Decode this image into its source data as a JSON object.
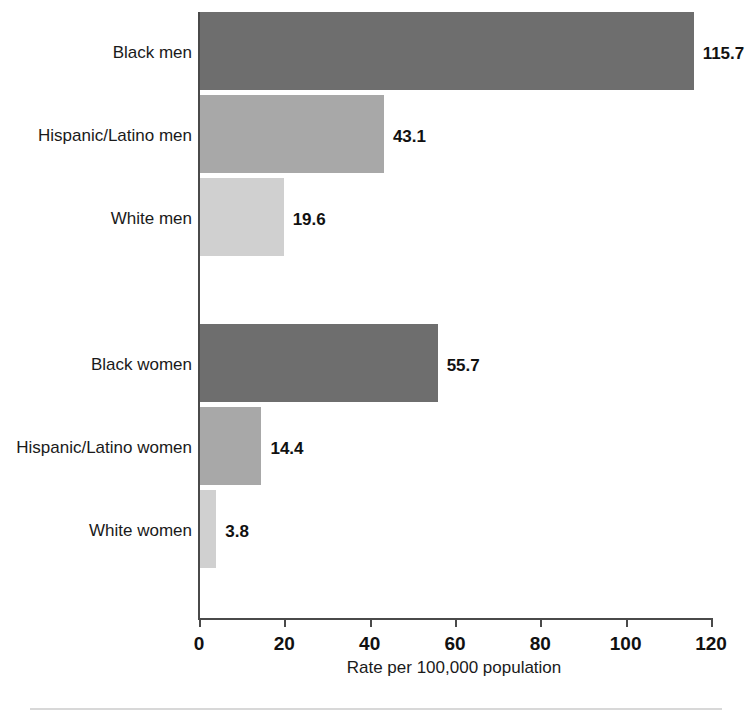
{
  "chart_data": {
    "type": "bar",
    "orientation": "horizontal",
    "title": "",
    "subtitle": "",
    "xlabel": "Rate per 100,000 population",
    "ylabel": "",
    "xlim": [
      0,
      120
    ],
    "xticks": [
      0,
      20,
      40,
      60,
      80,
      100,
      120
    ],
    "xtick_labels": [
      "0",
      "20",
      "40",
      "60",
      "80",
      "100",
      "120"
    ],
    "grid": false,
    "legend": "none",
    "categories": [
      "Black men",
      "Hispanic/Latino men",
      "White men",
      "Black women",
      "Hispanic/Latino women",
      "White women"
    ],
    "values": [
      115.7,
      43.1,
      19.6,
      55.7,
      14.4,
      3.8
    ],
    "value_labels": [
      "115.7",
      "43.1",
      "19.6",
      "55.7",
      "14.4",
      "3.8"
    ],
    "bar_colors": [
      "#6e6e6e",
      "#a8a8a8",
      "#d0d0d0",
      "#6e6e6e",
      "#a8a8a8",
      "#d0d0d0"
    ],
    "groups": [
      {
        "name": "men",
        "categories": [
          "Black men",
          "Hispanic/Latino men",
          "White men"
        ]
      },
      {
        "name": "women",
        "categories": [
          "Black women",
          "Hispanic/Latino women",
          "White women"
        ]
      }
    ]
  },
  "bars": [
    {
      "label": "Black men",
      "value": 115.7,
      "value_label": "115.7",
      "shade": "dark",
      "top": 12,
      "height": 78
    },
    {
      "label": "Hispanic/Latino men",
      "value": 43.1,
      "value_label": "43.1",
      "shade": "mid",
      "top": 95,
      "height": 78
    },
    {
      "label": "White men",
      "value": 19.6,
      "value_label": "19.6",
      "shade": "light",
      "top": 178,
      "height": 78
    },
    {
      "label": "Black women",
      "value": 55.7,
      "value_label": "55.7",
      "shade": "dark",
      "top": 324,
      "height": 78
    },
    {
      "label": "Hispanic/Latino women",
      "value": 14.4,
      "value_label": "14.4",
      "shade": "mid",
      "top": 407,
      "height": 78
    },
    {
      "label": "White women",
      "value": 3.8,
      "value_label": "3.8",
      "shade": "light",
      "top": 490,
      "height": 78
    }
  ],
  "axis": {
    "x_title": "Rate per 100,000 population",
    "ticks": [
      "0",
      "20",
      "40",
      "60",
      "80",
      "100",
      "120"
    ],
    "tick_values": [
      0,
      20,
      40,
      60,
      80,
      100,
      120
    ],
    "min": 0,
    "max": 120
  },
  "colors": {
    "dark": "#6e6e6e",
    "mid": "#a8a8a8",
    "light": "#d0d0d0",
    "axis": "#4a4a4a",
    "text": "#1a1a1a",
    "rule": "#d8d8d8",
    "background": "#ffffff"
  }
}
